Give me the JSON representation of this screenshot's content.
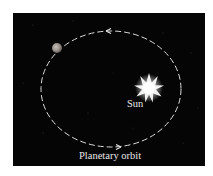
{
  "figure": {
    "background_color": "#050505",
    "page_color": "#ffffff",
    "orbit": {
      "label": "Planetary orbit",
      "style": "dashed",
      "color": "#dcdcdc",
      "direction": "counterclockwise",
      "center": [
        98,
        76
      ],
      "rx": 70,
      "ry": 58
    },
    "sun": {
      "label": "Sun",
      "center": [
        136,
        75
      ],
      "color": "#ffffff"
    },
    "planet": {
      "center": [
        44,
        35
      ],
      "radius": 5,
      "color": "#9a9490"
    }
  }
}
